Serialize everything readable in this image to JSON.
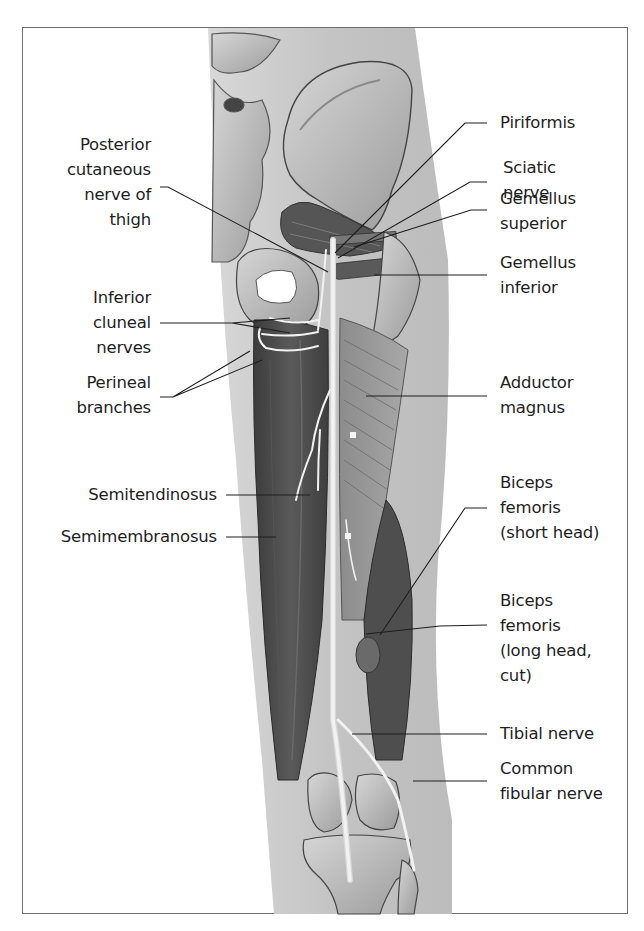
{
  "figure": {
    "colors": {
      "frame": "#6e6e6e",
      "skin": "#c9c9c9",
      "bone": "#bdbdbd",
      "muscle_dark": "#4a4a4a",
      "muscle_mid": "#7a7a7a",
      "nerve": "#efefef",
      "leader": "#1e1e1e"
    }
  },
  "labels_left": [
    {
      "id": "posterior-cutaneous-nerve-of-thigh",
      "lines": [
        "Posterior",
        "cutaneous",
        "nerve of",
        "thigh"
      ]
    },
    {
      "id": "inferior-cluneal-nerves",
      "lines": [
        "Inferior",
        "cluneal",
        "nerves"
      ]
    },
    {
      "id": "perineal-branches",
      "lines": [
        "Perineal",
        "branches"
      ]
    },
    {
      "id": "semitendinosus",
      "lines": [
        "Semitendinosus"
      ]
    },
    {
      "id": "semimembranosus",
      "lines": [
        "Semimembranosus"
      ]
    }
  ],
  "labels_right": [
    {
      "id": "piriformis",
      "lines": [
        "Piriformis"
      ]
    },
    {
      "id": "sciatic-nerve",
      "lines": [
        "Sciatic",
        "nerve"
      ]
    },
    {
      "id": "gemellus-superior",
      "lines": [
        "Gemellus",
        "superior"
      ]
    },
    {
      "id": "gemellus-inferior",
      "lines": [
        "Gemellus",
        "inferior"
      ]
    },
    {
      "id": "adductor-magnus",
      "lines": [
        "Adductor",
        "magnus"
      ]
    },
    {
      "id": "biceps-femoris-short-head",
      "lines": [
        "Biceps",
        "femoris",
        "(short head)"
      ]
    },
    {
      "id": "biceps-femoris-long-head-cut",
      "lines": [
        "Biceps",
        "femoris",
        "(long head,",
        "cut)"
      ]
    },
    {
      "id": "tibial-nerve",
      "lines": [
        "Tibial nerve"
      ]
    },
    {
      "id": "common-fibular-nerve",
      "lines": [
        "Common",
        "fibular nerve"
      ]
    }
  ]
}
